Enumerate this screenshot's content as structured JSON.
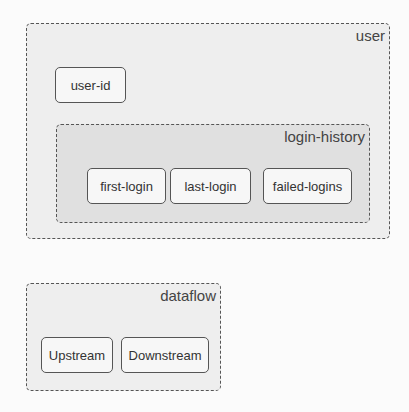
{
  "colors": {
    "background": "#fbfbfb",
    "outer_group_fill": "#eeeeee",
    "inner_group_fill": "#e0e0e0",
    "node_fill": "#f7f7f7",
    "border": "#555555",
    "text": "#333333"
  },
  "groups": {
    "user": {
      "label": "user",
      "nodes": {
        "user_id": "user-id"
      },
      "login_history": {
        "label": "login-history",
        "nodes": {
          "first_login": "first-login",
          "last_login": "last-login",
          "failed_logins": "failed-logins"
        }
      }
    },
    "dataflow": {
      "label": "dataflow",
      "nodes": {
        "upstream": "Upstream",
        "downstream": "Downstream"
      }
    }
  }
}
